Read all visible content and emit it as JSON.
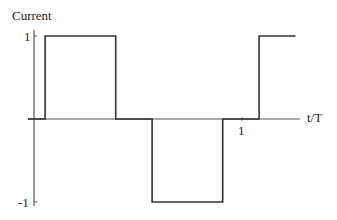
{
  "chart_data": {
    "type": "line",
    "title": "",
    "ylabel": "Current",
    "xlabel": "t/T",
    "ylim": [
      -1,
      1
    ],
    "xlim": [
      0,
      1.2
    ],
    "grid": false,
    "legend": null,
    "ytick_labels": [
      "1",
      "-1"
    ],
    "xtick_labels": [
      "1"
    ],
    "series": [
      {
        "name": "Current",
        "step": true,
        "points": [
          {
            "x": 0.0,
            "y": 0
          },
          {
            "x": 0.08,
            "y": 0
          },
          {
            "x": 0.08,
            "y": 1
          },
          {
            "x": 0.41,
            "y": 1
          },
          {
            "x": 0.41,
            "y": 0
          },
          {
            "x": 0.58,
            "y": 0
          },
          {
            "x": 0.58,
            "y": -1
          },
          {
            "x": 0.91,
            "y": -1
          },
          {
            "x": 0.91,
            "y": 0
          },
          {
            "x": 1.08,
            "y": 0
          },
          {
            "x": 1.08,
            "y": 1
          },
          {
            "x": 1.25,
            "y": 1
          }
        ]
      }
    ]
  },
  "labels": {
    "y_axis_title": "Current",
    "x_axis_title": "t/T",
    "y_tick_top": "1",
    "y_tick_bottom": "-1",
    "x_tick_one": "1"
  }
}
